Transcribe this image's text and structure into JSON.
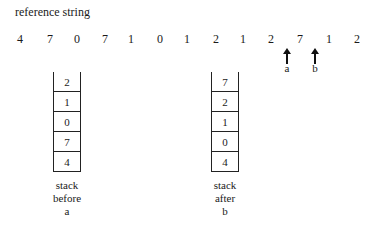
{
  "title": "reference string",
  "reference_string": [
    "4",
    "7",
    "0",
    "7",
    "1",
    "0",
    "1",
    "2",
    "1",
    "2",
    "7",
    "1",
    "2"
  ],
  "arrows": [
    {
      "label": "a",
      "icon": "up-arrow-icon"
    },
    {
      "label": "b",
      "icon": "up-arrow-icon"
    }
  ],
  "stacks": [
    {
      "cells": [
        "2",
        "1",
        "0",
        "7",
        "4"
      ],
      "caption": [
        "stack",
        "before",
        "a"
      ]
    },
    {
      "cells": [
        "7",
        "2",
        "1",
        "0",
        "4"
      ],
      "caption": [
        "stack",
        "after",
        "b"
      ]
    }
  ]
}
